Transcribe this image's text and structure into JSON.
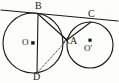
{
  "figure": {
    "background_color": "#fdfdfb",
    "stroke_color": "#1a1a18",
    "dash_color": "#55514c",
    "width": 119,
    "height": 83
  },
  "labels": {
    "b": "B",
    "c": "C",
    "o": "O",
    "a": "A",
    "o_prime": "O'",
    "d": "D"
  },
  "geometry": {
    "circles": [
      {
        "name": "left-circle",
        "cx": 33,
        "cy": 43,
        "r": 30
      },
      {
        "name": "right-circle",
        "cx": 90,
        "cy": 45,
        "r": 23
      }
    ],
    "points": {
      "B": {
        "x": 38,
        "y": 14
      },
      "C": {
        "x": 91,
        "y": 22
      },
      "A": {
        "x": 67,
        "y": 40
      },
      "D": {
        "x": 37,
        "y": 73
      },
      "O": {
        "x": 33,
        "y": 43
      },
      "O_prime": {
        "x": 90,
        "y": 45
      }
    },
    "tangent_line": {
      "x1": 1,
      "y1": 10,
      "x2": 118,
      "y2": 21
    },
    "solid_segments": [
      {
        "name": "segment-BD",
        "from": "B",
        "to": "D"
      },
      {
        "name": "segment-BA",
        "from": "B",
        "to": "A"
      },
      {
        "name": "segment-AC",
        "from": "A",
        "to": "C"
      }
    ],
    "dashed_segments": [
      {
        "name": "segment-DA",
        "from": "D",
        "to": "A"
      }
    ]
  }
}
